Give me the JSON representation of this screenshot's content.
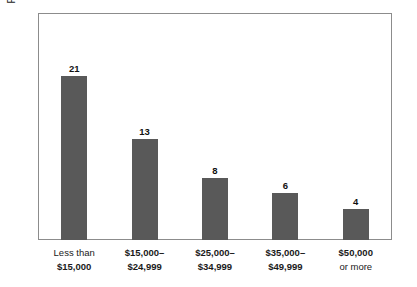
{
  "chart_data": {
    "type": "bar",
    "title": "",
    "xlabel": "",
    "ylabel": "Percent of Adults Age 18 or Older",
    "categories": [
      "Less than $15,000",
      "$15,000–$24,999",
      "$25,000–$34,999",
      "$35,000–$49,999",
      "$50,000 or more"
    ],
    "values": [
      21,
      13,
      8,
      6,
      4
    ],
    "ylim": [
      0,
      29
    ],
    "grid": false,
    "legend": false,
    "axis_ticks_visible": false,
    "bar_color": "#595959",
    "frame_color": "#8c8c8c",
    "value_labels": [
      "21",
      "13",
      "8",
      "6",
      "4"
    ],
    "category_label_lines": [
      {
        "top": "Less than",
        "top_weight": "regular",
        "bottom": "$15,000",
        "bottom_weight": "bold"
      },
      {
        "top": "$15,000–",
        "top_weight": "bold",
        "bottom": "$24,999",
        "bottom_weight": "bold"
      },
      {
        "top": "$25,000–",
        "top_weight": "bold",
        "bottom": "$34,999",
        "bottom_weight": "bold"
      },
      {
        "top": "$35,000–",
        "top_weight": "bold",
        "bottom": "$49,999",
        "bottom_weight": "bold"
      },
      {
        "top": "$50,000",
        "top_weight": "bold",
        "bottom": "or more",
        "bottom_weight": "regular"
      }
    ]
  }
}
